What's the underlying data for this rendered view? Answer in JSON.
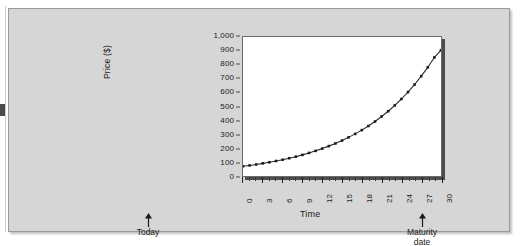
{
  "figure": {
    "background_color": "#d6d6d6",
    "plot_background_color": "#ffffff",
    "line_color": "#2b2b2b",
    "marker_color": "#1a1a1a"
  },
  "annotations": {
    "today": {
      "label": "Today",
      "icon": "arrow-up-icon",
      "at_x": 0
    },
    "maturity": {
      "label_line1": "Maturity",
      "label_line2": "date",
      "icon": "arrow-up-icon",
      "at_x": 30
    }
  },
  "chart_data": {
    "type": "line",
    "title": "",
    "xlabel": "Time",
    "ylabel": "Price ($)",
    "xlim": [
      0,
      30
    ],
    "ylim": [
      0,
      1000
    ],
    "grid": false,
    "legend": false,
    "markers": true,
    "ytick_labels": [
      "1,000",
      "900",
      "800",
      "700",
      "600",
      "500",
      "400",
      "300",
      "200",
      "100",
      "0"
    ],
    "ytick_values": [
      1000,
      900,
      800,
      700,
      600,
      500,
      400,
      300,
      200,
      100,
      0
    ],
    "xtick_labels": [
      "0",
      "3",
      "6",
      "9",
      "12",
      "15",
      "18",
      "21",
      "24",
      "27",
      "30"
    ],
    "xtick_values": [
      0,
      3,
      6,
      9,
      12,
      15,
      18,
      21,
      24,
      27,
      30
    ],
    "xtick_minor_step": 1,
    "x": [
      0,
      1,
      2,
      3,
      4,
      5,
      6,
      7,
      8,
      9,
      10,
      11,
      12,
      13,
      14,
      15,
      16,
      17,
      18,
      19,
      20,
      21,
      22,
      23,
      24,
      25,
      26,
      27,
      28,
      29,
      30
    ],
    "values": [
      70,
      76,
      83,
      91,
      99,
      108,
      117,
      128,
      139,
      152,
      166,
      181,
      197,
      215,
      234,
      255,
      278,
      303,
      330,
      360,
      392,
      428,
      466,
      508,
      554,
      604,
      658,
      718,
      782,
      853,
      905
    ],
    "series": [
      {
        "name": "Price",
        "values": [
          70,
          76,
          83,
          91,
          99,
          108,
          117,
          128,
          139,
          152,
          166,
          181,
          197,
          215,
          234,
          255,
          278,
          303,
          330,
          360,
          392,
          428,
          466,
          508,
          554,
          604,
          658,
          718,
          782,
          853,
          905
        ]
      }
    ]
  }
}
